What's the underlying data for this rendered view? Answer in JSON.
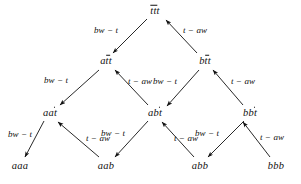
{
  "figure": {
    "kind": "lattice-diagram",
    "background_color": "#ffffff",
    "ink_color": "#111111",
    "width": 301,
    "height": 184
  },
  "labels": {
    "bw_t": "bw − t",
    "t_aw": "t − aw"
  },
  "chart_data": {
    "type": "diagram",
    "title": "",
    "nodes": [
      {
        "id": "ttt",
        "text_plain": "ttt",
        "stem": "",
        "overlined": "ttt",
        "x": 155,
        "y": 11,
        "level": 0
      },
      {
        "id": "att",
        "text_plain": "att",
        "stem": "a",
        "overlined": "tt",
        "x": 106,
        "y": 61,
        "level": 1
      },
      {
        "id": "btt",
        "text_plain": "btt",
        "stem": "b",
        "overlined": "tt",
        "x": 205,
        "y": 61,
        "level": 1
      },
      {
        "id": "aat",
        "text_plain": "aat",
        "stem": "aa",
        "overlined": "t",
        "x": 50,
        "y": 113,
        "level": 2
      },
      {
        "id": "abt",
        "text_plain": "abt",
        "stem": "ab",
        "overlined": "t",
        "x": 155,
        "y": 113,
        "level": 2
      },
      {
        "id": "bbt",
        "text_plain": "bbt",
        "stem": "bb",
        "overlined": "t",
        "x": 250,
        "y": 113,
        "level": 2
      },
      {
        "id": "aaa",
        "text_plain": "aaa",
        "stem": "aaa",
        "overlined": "",
        "x": 20,
        "y": 166,
        "level": 3
      },
      {
        "id": "aab",
        "text_plain": "aab",
        "stem": "aab",
        "overlined": "",
        "x": 106,
        "y": 166,
        "level": 3
      },
      {
        "id": "abb",
        "text_plain": "abb",
        "stem": "abb",
        "overlined": "",
        "x": 200,
        "y": 166,
        "level": 3
      },
      {
        "id": "bbb",
        "text_plain": "bbb",
        "stem": "bbb",
        "overlined": "",
        "x": 276,
        "y": 166,
        "level": 3
      }
    ],
    "edges": [
      {
        "from": "ttt",
        "to": "att",
        "label": "bw − t",
        "x1": 147,
        "y1": 19,
        "x2": 113,
        "y2": 53,
        "label_x": 106,
        "label_y": 30
      },
      {
        "from": "btt",
        "to": "ttt",
        "label": "t − aw",
        "x1": 197,
        "y1": 53,
        "x2": 166,
        "y2": 20,
        "label_x": 195,
        "label_y": 30
      },
      {
        "from": "att",
        "to": "aat",
        "label": "bw − t",
        "x1": 99,
        "y1": 70,
        "x2": 60,
        "y2": 105,
        "label_x": 56,
        "label_y": 80
      },
      {
        "from": "abt",
        "to": "att",
        "label": "t − aw",
        "x1": 148,
        "y1": 105,
        "x2": 115,
        "y2": 70,
        "label_x": 140,
        "label_y": 81
      },
      {
        "from": "btt",
        "to": "abt",
        "label": "bw − t",
        "x1": 199,
        "y1": 70,
        "x2": 167,
        "y2": 106,
        "label_x": 165,
        "label_y": 81
      },
      {
        "from": "bbt",
        "to": "btt",
        "label": "t − aw",
        "x1": 243,
        "y1": 105,
        "x2": 213,
        "y2": 70,
        "label_x": 243,
        "label_y": 81
      },
      {
        "from": "aat",
        "to": "aaa",
        "label": "bw − t",
        "x1": 44,
        "y1": 121,
        "x2": 25,
        "y2": 157,
        "label_x": 20,
        "label_y": 134
      },
      {
        "from": "aab",
        "to": "aat",
        "label": "t − aw",
        "x1": 99,
        "y1": 157,
        "x2": 58,
        "y2": 122,
        "label_x": 98,
        "label_y": 138
      },
      {
        "from": "abt",
        "to": "aab",
        "label": "bw − t",
        "x1": 148,
        "y1": 121,
        "x2": 115,
        "y2": 157,
        "label_x": 113,
        "label_y": 133
      },
      {
        "from": "abb",
        "to": "abt",
        "label": "t − aw",
        "x1": 194,
        "y1": 157,
        "x2": 162,
        "y2": 122,
        "label_x": 186,
        "label_y": 138
      },
      {
        "from": "bbt",
        "to": "abb",
        "label": "bw − t",
        "x1": 244,
        "y1": 121,
        "x2": 208,
        "y2": 157,
        "label_x": 207,
        "label_y": 133
      },
      {
        "from": "bbb",
        "to": "bbt",
        "label": "t − aw",
        "x1": 270,
        "y1": 157,
        "x2": 243,
        "y2": 122,
        "label_x": 272,
        "label_y": 137
      }
    ]
  }
}
